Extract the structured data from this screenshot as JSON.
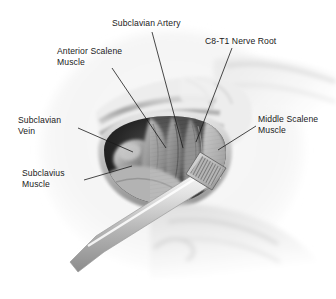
{
  "figure": {
    "kind": "surgical-anatomy-illustration",
    "style": "grayscale pencil/airbrush medical illustration",
    "background_color": "#ffffff",
    "ink_color": "#1a1a1a",
    "width": 336,
    "height": 299
  },
  "labels": {
    "subclavian_artery": "Subclavian Artery",
    "c8_t1_nerve_root": "C8-T1 Nerve Root",
    "anterior_scalene_muscle": "Anterior Scalene\nMuscle",
    "subclavian_vein": "Subclavian\nVein",
    "middle_scalene_muscle": "Middle Scalene\nMuscle",
    "subclavius_muscle": "Subclavius\nMuscle"
  },
  "leader_lines": [
    {
      "name": "leader-subclavian-artery",
      "from": [
        152,
        32
      ],
      "to": [
        183,
        148
      ]
    },
    {
      "name": "leader-c8t1-nerve-root",
      "from": [
        232,
        48
      ],
      "to": [
        196,
        142
      ]
    },
    {
      "name": "leader-anterior-scalene",
      "from": [
        112,
        68
      ],
      "to": [
        166,
        148
      ]
    },
    {
      "name": "leader-subclavian-vein",
      "from": [
        78,
        128
      ],
      "to": [
        133,
        152
      ]
    },
    {
      "name": "leader-middle-scalene",
      "from": [
        256,
        126
      ],
      "to": [
        218,
        150
      ]
    },
    {
      "name": "leader-subclavius",
      "from": [
        84,
        180
      ],
      "to": [
        132,
        166
      ]
    }
  ],
  "anatomy_regions": [
    {
      "name": "skin-and-soft-tissue-field",
      "tone": "#f2f2f2"
    },
    {
      "name": "clavicle-and-striated-muscle-bands",
      "tone": "#b9b9b9"
    },
    {
      "name": "retracted-wound-margin",
      "tone": "#cfcfcf"
    },
    {
      "name": "deep-wound-cavity-shadow",
      "tone": "#2a2a2a"
    },
    {
      "name": "subclavian-vein-structure",
      "tone": "#9a9a9a"
    },
    {
      "name": "subclavian-artery-structure",
      "tone": "#6e6e6e"
    },
    {
      "name": "anterior-scalene-muscle-belly",
      "tone": "#8a8a8a"
    },
    {
      "name": "middle-scalene-muscle-belly",
      "tone": "#a8a8a8"
    },
    {
      "name": "c8-t1-nerve-root-bundle",
      "tone": "#7a7a7a"
    },
    {
      "name": "subclavius-muscle-body",
      "tone": "#b0b0b0"
    },
    {
      "name": "lateral-neck-contour",
      "tone": "#e3e3e3"
    }
  ],
  "instrument": {
    "name": "surgical-retractor-rasp",
    "head": "cross-hatched serrated rectangular tip",
    "shaft": "long tapered metallic shaft angled to lower-left",
    "head_tone": "#8f8f8f",
    "shaft_tone": "#d8d8d8"
  }
}
